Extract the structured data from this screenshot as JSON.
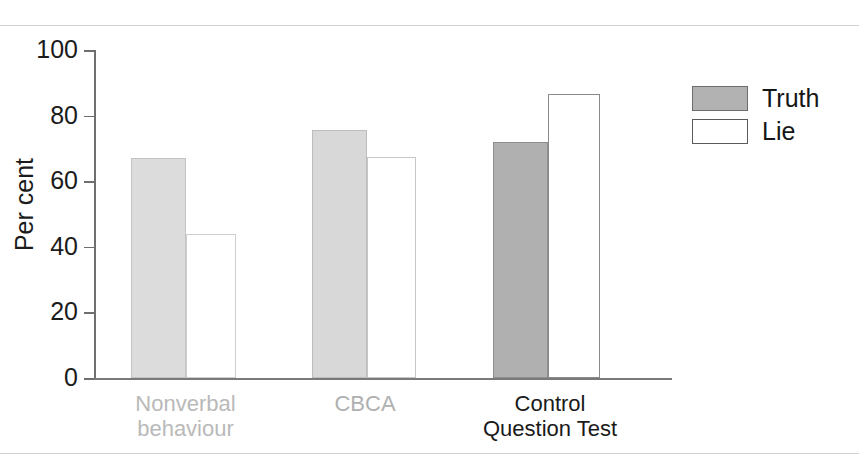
{
  "chart_data": {
    "type": "bar",
    "title": "",
    "subtitle": "",
    "xlabel": "",
    "ylabel": "Per cent",
    "ylim": [
      0,
      100
    ],
    "yticks": [
      0,
      20,
      40,
      60,
      80,
      100
    ],
    "ytick_labels": [
      "0",
      "20",
      "40",
      "60",
      "80",
      "100"
    ],
    "grid": false,
    "legend_position": "right",
    "categories": [
      "Nonverbal behaviour",
      "CBCA",
      "Control Question Test"
    ],
    "series": [
      {
        "name": "Truth",
        "values": [
          67,
          75.5,
          72
        ]
      },
      {
        "name": "Lie",
        "values": [
          44,
          67.5,
          86.5
        ]
      }
    ],
    "annotations": []
  },
  "axis": {
    "y_title": "Per cent",
    "tick_labels": [
      {
        "value": 100,
        "text": "100"
      },
      {
        "value": 80,
        "text": "80"
      },
      {
        "value": 60,
        "text": "60"
      },
      {
        "value": 40,
        "text": "40"
      },
      {
        "value": 20,
        "text": "20"
      },
      {
        "value": 0,
        "text": "0"
      }
    ]
  },
  "categories": [
    {
      "id": "nonverbal-behaviour",
      "line1": "Nonverbal",
      "line2": "behaviour",
      "text": "Nonverbal\nbehaviour",
      "color": "#b9b9b9"
    },
    {
      "id": "cbca",
      "line1": "CBCA",
      "line2": "",
      "text": "CBCA",
      "color": "#b0b0b0"
    },
    {
      "id": "control-question-test",
      "line1": "Control",
      "line2": "Question Test",
      "text": "Control\nQuestion Test",
      "color": "#1a1a1a"
    }
  ],
  "bars": [
    {
      "id": "nonverbal-behaviour-truth",
      "category": "Nonverbal behaviour",
      "series": "Truth",
      "value": 67,
      "fill": "#dcdcdc",
      "stroke": "#c3c3c3"
    },
    {
      "id": "nonverbal-behaviour-lie",
      "category": "Nonverbal behaviour",
      "series": "Lie",
      "value": 44,
      "fill": "#ffffff",
      "stroke": "#cfcfcf"
    },
    {
      "id": "cbca-truth",
      "category": "CBCA",
      "series": "Truth",
      "value": 75.5,
      "fill": "#d8d8d8",
      "stroke": "#bdbdbd"
    },
    {
      "id": "cbca-lie",
      "category": "CBCA",
      "series": "Lie",
      "value": 67.5,
      "fill": "#ffffff",
      "stroke": "#c6c6c6"
    },
    {
      "id": "control-question-test-truth",
      "category": "Control Question Test",
      "series": "Truth",
      "value": 72,
      "fill": "#b0b0b0",
      "stroke": "#8e8e8e"
    },
    {
      "id": "control-question-test-lie",
      "category": "Control Question Test",
      "series": "Lie",
      "value": 86.5,
      "fill": "#ffffff",
      "stroke": "#8b8b8b"
    }
  ],
  "legend": {
    "items": [
      {
        "label": "Truth",
        "fill": "#b2b2b2",
        "stroke": "#6d6d6d"
      },
      {
        "label": "Lie",
        "fill": "#ffffff",
        "stroke": "#5a5a5a"
      }
    ]
  },
  "colors": {
    "axis": "#6f6f6f",
    "rule": "#d2d2d4",
    "text": "#1b1b1b",
    "faded_text": "#b5b5b5",
    "truth_fill": "#b2b2b2",
    "lie_fill": "#ffffff"
  }
}
